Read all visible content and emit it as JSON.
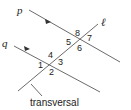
{
  "diagram": {
    "type": "parallel-lines-with-transversal",
    "lines": {
      "p": {
        "label": "p",
        "parallel_to": "q"
      },
      "q": {
        "label": "q",
        "parallel_to": "p"
      },
      "l": {
        "label": "ℓ",
        "role": "transversal"
      }
    },
    "angles_at_p": [
      "8",
      "5",
      "7",
      "6"
    ],
    "angles_at_q": [
      "4",
      "1",
      "3",
      "2"
    ],
    "transversal_label": "transversal",
    "colors": {
      "line": "#6b6b6b",
      "text": "#222222"
    }
  },
  "labels": {
    "p": "p",
    "q": "q",
    "l": "ℓ",
    "a1": "1",
    "a2": "2",
    "a3": "3",
    "a4": "4",
    "a5": "5",
    "a6": "6",
    "a7": "7",
    "a8": "8",
    "transversal": "transversal"
  }
}
